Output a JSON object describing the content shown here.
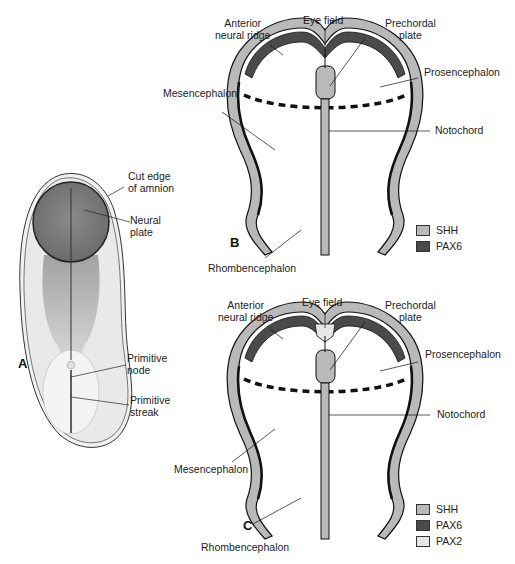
{
  "colors": {
    "shh": "#b9b9b9",
    "pax6": "#4a4a4a",
    "pax2": "#e6e6e6",
    "outline": "#111111"
  },
  "panel_a": {
    "letter": "A",
    "labels": {
      "cut_edge": "Cut edge\nof amnion",
      "neural_plate": "Neural\nplate",
      "primitive_node": "Primitive\nnode",
      "primitive_streak": "Primitive\nstreak"
    }
  },
  "panel_b": {
    "letter": "B",
    "labels": {
      "anterior_neural_ridge": "Anterior\nneural ridge",
      "eye_field": "Eye field",
      "prechordal_plate": "Prechordal\nplate",
      "prosencephalon": "Prosencephalon",
      "mesencephalon": "Mesencephalon",
      "notochord": "Notochord",
      "rhombencephalon": "Rhombencephalon"
    },
    "legend": [
      {
        "name": "SHH",
        "color": "#b9b9b9"
      },
      {
        "name": "PAX6",
        "color": "#4a4a4a"
      }
    ]
  },
  "panel_c": {
    "letter": "C",
    "labels": {
      "anterior_neural_ridge": "Anterior\nneural ridge",
      "eye_field": "Eye field",
      "prechordal_plate": "Prechordal\nplate",
      "prosencephalon": "Prosencephalon",
      "mesencephalon": "Mesencephalon",
      "notochord": "Notochord",
      "rhombencephalon": "Rhombencephalon"
    },
    "legend": [
      {
        "name": "SHH",
        "color": "#b9b9b9"
      },
      {
        "name": "PAX6",
        "color": "#4a4a4a"
      },
      {
        "name": "PAX2",
        "color": "#e6e6e6"
      }
    ]
  }
}
